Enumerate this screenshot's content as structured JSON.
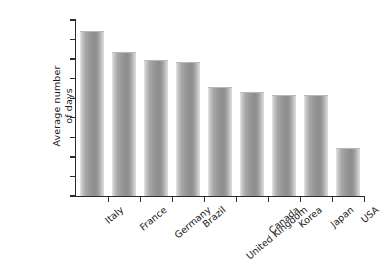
{
  "chart_data": {
    "type": "bar",
    "title": "",
    "subtitle": "",
    "xlabel": "",
    "ylabel": "Average number of days",
    "ylabel_lines": [
      "Average number",
      "of days"
    ],
    "categories": [
      "Italy",
      "France",
      "Germany",
      "Brazil",
      "United Kingdom",
      "Canada",
      "Korea",
      "Japan",
      "USA"
    ],
    "values": [
      42,
      36.5,
      34.5,
      34,
      27.5,
      26.3,
      25.5,
      25.5,
      12
    ],
    "ylim": [
      0,
      45
    ],
    "ytick_values": [
      0,
      5,
      10,
      15,
      20,
      25,
      30,
      35,
      40,
      45
    ],
    "ytick_labels": [
      "0",
      "5",
      "10",
      "15",
      "20",
      "25",
      "30",
      "35",
      "40",
      "45"
    ],
    "grid": false,
    "legend": false,
    "legend_position": "none",
    "bar_color": "#949494",
    "axis_color": "#2b2b2b",
    "background_color": "#ffffff",
    "x_label_rotation_deg": -40
  }
}
